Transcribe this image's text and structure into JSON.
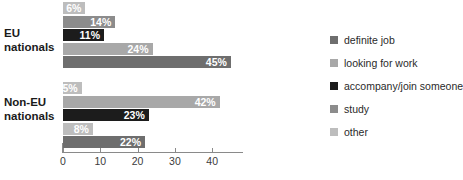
{
  "chart_data": {
    "type": "bar",
    "orientation": "horizontal",
    "title": "",
    "xlabel": "",
    "ylabel": "",
    "xlim": [
      0,
      48
    ],
    "grid": false,
    "legend_position": "right",
    "categories": [
      "EU nationals",
      "Non-EU nationals"
    ],
    "series": [
      {
        "name": "definite job",
        "color": "#6e6e6e",
        "values": [
          45,
          22
        ]
      },
      {
        "name": "looking for work",
        "color": "#a8a8a8",
        "values": [
          24,
          42
        ]
      },
      {
        "name": "accompany/join someone",
        "color": "#1c1c1c",
        "values": [
          11,
          23
        ]
      },
      {
        "name": "study",
        "color": "#8c8c8c",
        "values": [
          14,
          8
        ]
      },
      {
        "name": "other",
        "color": "#bdbdbd",
        "values": [
          6,
          5
        ]
      }
    ],
    "bar_order_top_to_bottom": [
      "other",
      "study",
      "accompany/join someone",
      "looking for work",
      "definite job"
    ],
    "value_labels": {
      "EU nationals": [
        "6%",
        "14%",
        "11%",
        "24%",
        "45%"
      ],
      "Non-EU nationals": [
        "5%",
        "42%",
        "23%",
        "8%",
        "22%"
      ]
    },
    "xticks": [
      0,
      10,
      20,
      30,
      40
    ],
    "xtick_labels": [
      "0",
      "10",
      "20",
      "30",
      "40"
    ]
  },
  "axis": {
    "ticks": [
      {
        "value": 0,
        "label": "0"
      },
      {
        "value": 10,
        "label": "10"
      },
      {
        "value": 20,
        "label": "20"
      },
      {
        "value": 30,
        "label": "30"
      },
      {
        "value": 40,
        "label": "40"
      }
    ]
  },
  "groups": [
    {
      "label": "EU nationals",
      "line1": "EU",
      "line2": "nationals",
      "bars": [
        {
          "series": "other",
          "value": 6,
          "label": "6%",
          "color": "#bdbdbd",
          "text_color": "#ffffff",
          "inside": true
        },
        {
          "series": "study",
          "value": 14,
          "label": "14%",
          "color": "#8c8c8c",
          "text_color": "#ffffff",
          "inside": true
        },
        {
          "series": "accompany/join someone",
          "value": 11,
          "label": "11%",
          "color": "#1c1c1c",
          "text_color": "#ffffff",
          "inside": true
        },
        {
          "series": "looking for work",
          "value": 24,
          "label": "24%",
          "color": "#a8a8a8",
          "text_color": "#ffffff",
          "inside": true
        },
        {
          "series": "definite job",
          "value": 45,
          "label": "45%",
          "color": "#6e6e6e",
          "text_color": "#ffffff",
          "inside": true
        }
      ]
    },
    {
      "label": "Non-EU nationals",
      "line1": "Non-EU",
      "line2": "nationals",
      "bars": [
        {
          "series": "other",
          "value": 5,
          "label": "5%",
          "color": "#bdbdbd",
          "text_color": "#ffffff",
          "inside": true
        },
        {
          "series": "study",
          "value": 42,
          "label": "42%",
          "color": "#a8a8a8",
          "text_color": "#ffffff",
          "inside": true
        },
        {
          "series": "accompany/join someone",
          "value": 23,
          "label": "23%",
          "color": "#1c1c1c",
          "text_color": "#ffffff",
          "inside": true
        },
        {
          "series": "looking for work",
          "value": 8,
          "label": "8%",
          "color": "#bdbdbd",
          "text_color": "#ffffff",
          "inside": true
        },
        {
          "series": "definite job",
          "value": 22,
          "label": "22%",
          "color": "#6e6e6e",
          "text_color": "#ffffff",
          "inside": true
        }
      ]
    }
  ],
  "legend": {
    "items": [
      {
        "label": "definite job",
        "color": "#6e6e6e"
      },
      {
        "label": "looking for work",
        "color": "#a8a8a8"
      },
      {
        "label": "accompany/join someone",
        "color": "#1c1c1c"
      },
      {
        "label": "study",
        "color": "#8c8c8c"
      },
      {
        "label": "other",
        "color": "#bdbdbd"
      }
    ]
  },
  "geometry": {
    "x0_px": 63,
    "px_per_unit": 3.73,
    "bar_height_px": 12,
    "bar_gap_px": 1.5,
    "group_tops_px": [
      2,
      82
    ]
  }
}
